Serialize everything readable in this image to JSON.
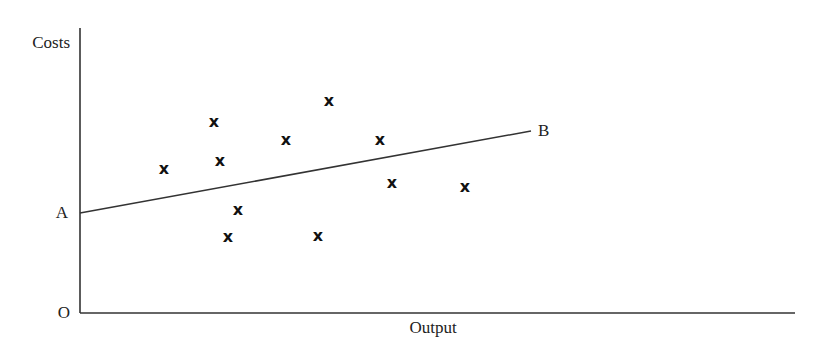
{
  "diagram": {
    "type": "scatter-with-line",
    "y_axis_label": "Costs",
    "x_axis_label": "Output",
    "origin_label": "O",
    "line_start_label": "A",
    "line_end_label": "B",
    "marker_glyph": "x",
    "colors": {
      "ink": "#333333",
      "background": "#ffffff"
    }
  },
  "chart_data": {
    "type": "scatter",
    "title": "",
    "xlabel": "Output",
    "ylabel": "Costs",
    "grid": false,
    "legend": "none",
    "points_px": [
      [
        164,
        168
      ],
      [
        214,
        121
      ],
      [
        220,
        160
      ],
      [
        286,
        139
      ],
      [
        329,
        100
      ],
      [
        380,
        139
      ],
      [
        392,
        182
      ],
      [
        465,
        186
      ],
      [
        238,
        209
      ],
      [
        228,
        236
      ],
      [
        318,
        235
      ]
    ],
    "line": {
      "from_label": "A",
      "to_label": "B",
      "from_px": [
        80,
        213
      ],
      "to_px": [
        531,
        131
      ]
    },
    "axes_px": {
      "origin": [
        80,
        313
      ],
      "y_top": 28,
      "x_right": 795
    }
  }
}
